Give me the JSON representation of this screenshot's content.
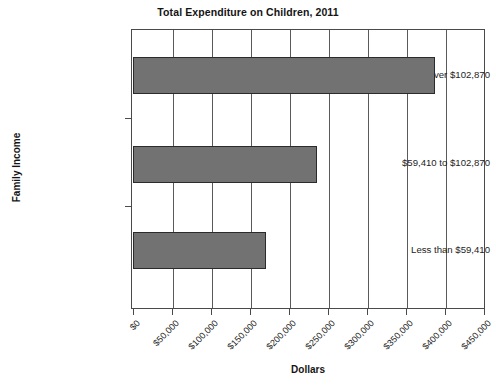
{
  "chart_data": {
    "type": "bar",
    "orientation": "horizontal",
    "title": "Total Expenditure on Children, 2011",
    "xlabel": "Dollars",
    "ylabel": "Family Income",
    "categories": [
      "Less than $59,410",
      "$59,410 to $102,870",
      "Over $102,870"
    ],
    "values": [
      171000,
      236000,
      387000
    ],
    "xlim": [
      0,
      450000
    ],
    "xticks": [
      0,
      50000,
      100000,
      150000,
      200000,
      250000,
      300000,
      350000,
      400000,
      450000
    ],
    "xticklabels": [
      "$0",
      "$50,000",
      "$100,000",
      "$150,000",
      "$200,000",
      "$250,000",
      "$300,000",
      "$350,000",
      "$400,000",
      "$450,000"
    ],
    "grid": "vertical",
    "legend": "none",
    "bar_color": "#727272",
    "bar_edge_color": "#2b2b2b",
    "axis_color": "#4a4a4a",
    "background": "#ffffff"
  }
}
